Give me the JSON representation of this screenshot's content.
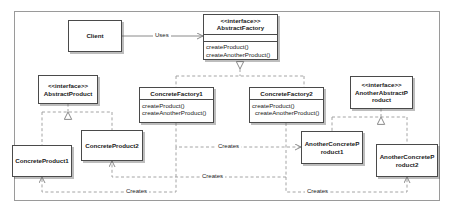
{
  "diagram": {
    "type": "uml-class-diagram",
    "pattern": "Abstract Factory",
    "frame": {
      "present": true,
      "border_color": "#9a9a9a"
    },
    "style": {
      "node_border": "#4a4a4a",
      "node_fill": "#ffffff",
      "line_color": "#8a8a8a",
      "text_color": "#1a1a1a"
    },
    "nodes": [
      {
        "id": "client",
        "name": "Client",
        "stereotype": "",
        "operations": [],
        "x": 68,
        "y": 20,
        "w": 54,
        "h": 32
      },
      {
        "id": "abstract-factory",
        "name": "AbstractFactory",
        "stereotype": "<<interface>>",
        "operations": [
          "createProduct()",
          "createAnotherProduct()"
        ],
        "x": 203,
        "y": 14,
        "w": 75,
        "h": 46
      },
      {
        "id": "abstract-product",
        "name": "AbstractProduct",
        "stereotype": "<<interface>>",
        "operations": [],
        "x": 38,
        "y": 75,
        "w": 60,
        "h": 29
      },
      {
        "id": "concrete-factory-1",
        "name": "ConcreteFactory1",
        "stereotype": "",
        "operations": [
          "createProduct()",
          "createAnotherProduct()"
        ],
        "x": 139,
        "y": 87,
        "w": 75,
        "h": 36
      },
      {
        "id": "concrete-factory-2",
        "name": "ConcreteFactory2",
        "stereotype": "",
        "operations": [
          "createProduct()",
          "createAnotherProduct()"
        ],
        "x": 249,
        "y": 87,
        "w": 75,
        "h": 36
      },
      {
        "id": "another-abstract-product",
        "name": "AnotherAbstractProduct",
        "name_line1": "AnotherAbstractP",
        "name_line2": "roduct",
        "stereotype": "<<interface>>",
        "operations": [],
        "x": 350,
        "y": 76,
        "w": 63,
        "h": 33
      },
      {
        "id": "concrete-product-2",
        "name": "ConcreteProduct2",
        "stereotype": "",
        "operations": [],
        "x": 81,
        "y": 130,
        "w": 62,
        "h": 31
      },
      {
        "id": "concrete-product-1",
        "name": "ConcreteProduct1",
        "stereotype": "",
        "operations": [],
        "x": 12,
        "y": 145,
        "w": 60,
        "h": 32
      },
      {
        "id": "another-concrete-product-1",
        "name": "AnotherConcreteProduct1",
        "name_line1": "AnotherConcreteP",
        "name_line2": "roduct1",
        "stereotype": "",
        "operations": [],
        "x": 301,
        "y": 131,
        "w": 62,
        "h": 33
      },
      {
        "id": "another-concrete-product-2",
        "name": "AnotherConcreteProduct2",
        "name_line1": "AnotherConcreteP",
        "name_line2": "roduct2",
        "stereotype": "",
        "operations": [],
        "x": 376,
        "y": 144,
        "w": 62,
        "h": 33
      }
    ],
    "edges": [
      {
        "id": "uses",
        "label": "Uses",
        "from": "client",
        "to": "abstract-factory",
        "kind": "association",
        "line": "solid",
        "arrow": "open"
      },
      {
        "id": "cf1-realizes",
        "label": "",
        "from": "concrete-factory-1",
        "to": "abstract-factory",
        "kind": "realization",
        "line": "dashed",
        "arrow": "hollow-triangle"
      },
      {
        "id": "cf2-realizes",
        "label": "",
        "from": "concrete-factory-2",
        "to": "abstract-factory",
        "kind": "realization",
        "line": "dashed",
        "arrow": "hollow-triangle"
      },
      {
        "id": "cp1-realizes",
        "label": "",
        "from": "concrete-product-1",
        "to": "abstract-product",
        "kind": "realization",
        "line": "dashed",
        "arrow": "hollow-triangle"
      },
      {
        "id": "cp2-realizes",
        "label": "",
        "from": "concrete-product-2",
        "to": "abstract-product",
        "kind": "realization",
        "line": "dashed",
        "arrow": "hollow-triangle"
      },
      {
        "id": "acp1-realizes",
        "label": "",
        "from": "another-concrete-product-1",
        "to": "another-abstract-product",
        "kind": "realization",
        "line": "dashed",
        "arrow": "hollow-triangle"
      },
      {
        "id": "acp2-realizes",
        "label": "",
        "from": "another-concrete-product-2",
        "to": "another-abstract-product",
        "kind": "realization",
        "line": "dashed",
        "arrow": "hollow-triangle"
      },
      {
        "id": "cf1-creates-acp1",
        "label": "Creates",
        "from": "concrete-factory-1",
        "to": "another-concrete-product-1",
        "kind": "dependency",
        "line": "dashed",
        "arrow": "open"
      },
      {
        "id": "cf1-creates-cp1",
        "label": "Creates",
        "from": "concrete-factory-1",
        "to": "concrete-product-1",
        "kind": "dependency",
        "line": "dashed",
        "arrow": "open"
      },
      {
        "id": "cf2-creates-cp2",
        "label": "Creates",
        "from": "concrete-factory-2",
        "to": "concrete-product-2",
        "kind": "dependency",
        "line": "dashed",
        "arrow": "open"
      },
      {
        "id": "cf2-creates-acp2",
        "label": "Creates",
        "from": "concrete-factory-2",
        "to": "another-concrete-product-2",
        "kind": "dependency",
        "line": "dashed",
        "arrow": "open"
      }
    ],
    "labels": {
      "uses": "Uses",
      "creates_top": "Creates",
      "creates_mid": "Creates",
      "creates_bottom_left": "Creates",
      "creates_bottom_right": "Creates"
    }
  }
}
